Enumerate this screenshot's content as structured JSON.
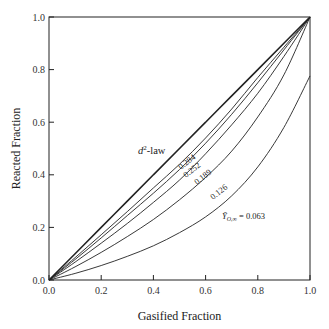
{
  "chart_data": {
    "type": "line",
    "title": "",
    "xlabel": "Gasified Fraction",
    "ylabel": "Reacted Fraction",
    "xlim": [
      0.0,
      1.0
    ],
    "ylim": [
      0.0,
      1.0
    ],
    "xticks": [
      "0.0",
      "0.2",
      "0.4",
      "0.6",
      "0.8",
      "1.0"
    ],
    "yticks": [
      "0.0",
      "0.2",
      "0.4",
      "0.6",
      "0.8",
      "1.0"
    ],
    "grid": false,
    "legend": "inline labels",
    "x": [
      0.0,
      0.1,
      0.2,
      0.3,
      0.4,
      0.5,
      0.6,
      0.7,
      0.8,
      0.9,
      1.0
    ],
    "series": [
      {
        "name": "d2-law",
        "label_main": "d",
        "label_sup": "2",
        "label_rest": "-law",
        "bold": true,
        "values": [
          0.0,
          0.1,
          0.2,
          0.3,
          0.4,
          0.5,
          0.6,
          0.7,
          0.8,
          0.9,
          1.0
        ]
      },
      {
        "name": "0.284",
        "label": "0.284",
        "values": [
          0.0,
          0.085,
          0.172,
          0.26,
          0.35,
          0.44,
          0.54,
          0.65,
          0.77,
          0.885,
          1.0
        ]
      },
      {
        "name": "0.252",
        "label": "0.252",
        "values": [
          0.0,
          0.078,
          0.16,
          0.245,
          0.33,
          0.42,
          0.52,
          0.63,
          0.75,
          0.875,
          1.0
        ]
      },
      {
        "name": "0.189",
        "label": "0.189",
        "values": [
          0.0,
          0.068,
          0.14,
          0.215,
          0.295,
          0.38,
          0.48,
          0.59,
          0.71,
          0.85,
          1.0
        ]
      },
      {
        "name": "0.126",
        "label": "0.126",
        "values": [
          0.0,
          0.05,
          0.105,
          0.165,
          0.23,
          0.305,
          0.39,
          0.49,
          0.62,
          0.78,
          1.0
        ]
      },
      {
        "name": "0.063",
        "label_prefix": "Ỹ",
        "label_sub": "O,∞",
        "label_rest": " = 0.063",
        "values": [
          0.0,
          0.025,
          0.055,
          0.09,
          0.13,
          0.18,
          0.24,
          0.32,
          0.43,
          0.58,
          0.776
        ]
      }
    ]
  }
}
